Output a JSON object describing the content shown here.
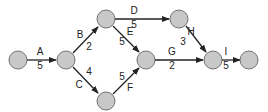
{
  "diagram": {
    "type": "activity-network",
    "node_fill": "#c8c8c8",
    "node_stroke": "#555555",
    "edge_color": "#222222",
    "nodes": [
      {
        "id": "n1",
        "x": 18,
        "y": 60
      },
      {
        "id": "n2",
        "x": 66,
        "y": 60
      },
      {
        "id": "n3",
        "x": 106,
        "y": 19
      },
      {
        "id": "n4",
        "x": 106,
        "y": 101
      },
      {
        "id": "n5",
        "x": 146,
        "y": 60
      },
      {
        "id": "n6",
        "x": 179,
        "y": 19
      },
      {
        "id": "n7",
        "x": 213,
        "y": 60
      },
      {
        "id": "n8",
        "x": 249,
        "y": 60
      }
    ],
    "edges": [
      {
        "from": "n1",
        "to": "n2",
        "activity": "A",
        "duration": "5"
      },
      {
        "from": "n2",
        "to": "n3",
        "activity": "B",
        "duration": "2"
      },
      {
        "from": "n2",
        "to": "n4",
        "activity": "C",
        "duration": "4"
      },
      {
        "from": "n3",
        "to": "n6",
        "activity": "D",
        "duration": "5"
      },
      {
        "from": "n3",
        "to": "n5",
        "activity": "E",
        "duration": "5"
      },
      {
        "from": "n4",
        "to": "n5",
        "activity": "F",
        "duration": "5"
      },
      {
        "from": "n5",
        "to": "n7",
        "activity": "G",
        "duration": "2"
      },
      {
        "from": "n6",
        "to": "n7",
        "activity": "H",
        "duration": "3"
      },
      {
        "from": "n7",
        "to": "n8",
        "activity": "I",
        "duration": "5"
      }
    ]
  },
  "labels": {
    "A": {
      "activity": "A",
      "duration": "5"
    },
    "B": {
      "activity": "B",
      "duration": "2"
    },
    "C": {
      "activity": "C",
      "duration": "4"
    },
    "D": {
      "activity": "D",
      "duration": "5"
    },
    "E": {
      "activity": "E",
      "duration": "5"
    },
    "F": {
      "activity": "F",
      "duration": "5"
    },
    "G": {
      "activity": "G",
      "duration": "2"
    },
    "H": {
      "activity": "H",
      "duration": "3"
    },
    "I": {
      "activity": "I",
      "duration": "5"
    }
  }
}
